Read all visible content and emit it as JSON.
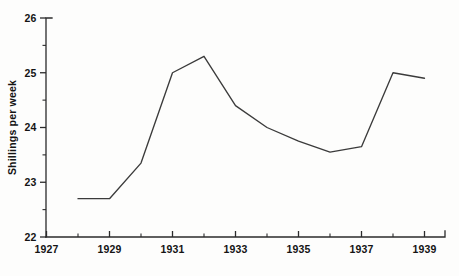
{
  "chart_data": {
    "type": "line",
    "title": "",
    "subtitle": "",
    "xlabel": "",
    "ylabel": "Shillings per week",
    "xlim": [
      1927,
      1940
    ],
    "ylim": [
      22,
      26
    ],
    "grid": false,
    "legend": null,
    "x_tick_labels": [
      "1927",
      "1929",
      "1931",
      "1933",
      "1935",
      "1937",
      "1939"
    ],
    "x_tick_values": [
      1927,
      1929,
      1931,
      1933,
      1935,
      1937,
      1939
    ],
    "x_minor_tick_values": [
      1928,
      1930,
      1932,
      1934,
      1936,
      1938,
      1940
    ],
    "y_tick_labels": [
      "22",
      "23",
      "24",
      "25",
      "26"
    ],
    "y_tick_values": [
      22,
      23,
      24,
      25,
      26
    ],
    "y_minor_tick_values": [
      22.5,
      23.5,
      24.5,
      25.5
    ],
    "series": [
      {
        "name": "Shillings per week",
        "color": "#3b3b3b",
        "x": [
          1928,
          1929,
          1930,
          1931,
          1932,
          1933,
          1934,
          1935,
          1936,
          1937,
          1938,
          1939
        ],
        "values": [
          22.7,
          22.7,
          23.35,
          25.0,
          25.3,
          24.4,
          24.0,
          23.75,
          23.55,
          23.65,
          25.0,
          24.9
        ]
      }
    ]
  }
}
